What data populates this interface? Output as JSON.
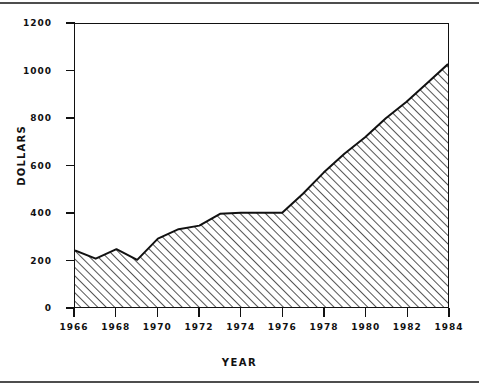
{
  "chart_data": {
    "type": "area",
    "title": "",
    "xlabel": "YEAR",
    "ylabel": "DOLLARS",
    "xlim": [
      1966,
      1984
    ],
    "ylim": [
      0,
      1200
    ],
    "grid": false,
    "legend": "none",
    "fill_style": "diagonal-hatch",
    "x_tick_labels": [
      "1966",
      "1968",
      "1970",
      "1972",
      "1974",
      "1976",
      "1978",
      "1980",
      "1982",
      "1984"
    ],
    "x_tick_values": [
      1966,
      1968,
      1970,
      1972,
      1974,
      1976,
      1978,
      1980,
      1982,
      1984
    ],
    "y_tick_labels": [
      "0",
      "200",
      "400",
      "600",
      "800",
      "1000",
      "1200"
    ],
    "y_tick_values": [
      0,
      200,
      400,
      600,
      800,
      1000,
      1200
    ],
    "x": [
      1966,
      1967,
      1968,
      1969,
      1970,
      1971,
      1972,
      1973,
      1974,
      1975,
      1976,
      1977,
      1978,
      1979,
      1980,
      1981,
      1982,
      1983,
      1984
    ],
    "values": [
      240,
      205,
      245,
      200,
      290,
      330,
      345,
      395,
      400,
      400,
      400,
      480,
      570,
      650,
      720,
      800,
      870,
      950,
      1030
    ],
    "series": [
      {
        "name": "DOLLARS",
        "values": [
          240,
          205,
          245,
          200,
          290,
          330,
          345,
          395,
          400,
          400,
          400,
          480,
          570,
          650,
          720,
          800,
          870,
          950,
          1030
        ]
      }
    ]
  },
  "axes": {
    "y_title": "DOLLARS",
    "x_title": "YEAR"
  }
}
